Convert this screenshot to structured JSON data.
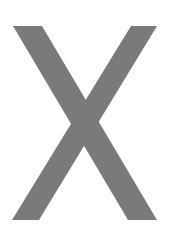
{
  "glyph": {
    "character": "X",
    "color": "#7a7a7a",
    "background": "#ffffff",
    "strokes": {
      "left_stroke": {
        "top_left": [
          13,
          26
        ],
        "top_right": [
          42,
          26
        ],
        "bottom_right": [
          157,
          220
        ],
        "bottom_left": [
          128,
          220
        ]
      },
      "right_stroke": {
        "top_left": [
          131,
          26
        ],
        "top_right": [
          157,
          26
        ],
        "bottom_right": [
          39,
          220
        ],
        "bottom_left": [
          12,
          220
        ]
      }
    }
  }
}
